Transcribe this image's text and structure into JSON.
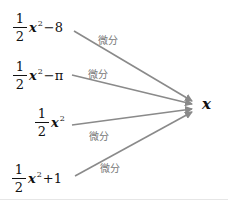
{
  "diagram": {
    "target": "x",
    "edge_label": "微分",
    "colors": {
      "arrow": "#8a8a8a",
      "label": "#777777",
      "text": "#111111"
    },
    "sources": [
      {
        "num": "1",
        "den": "2",
        "var": "x",
        "exp": "2",
        "rest": "−8",
        "label": "微分"
      },
      {
        "num": "1",
        "den": "2",
        "var": "x",
        "exp": "2",
        "rest": "−π",
        "label": "微分"
      },
      {
        "num": "1",
        "den": "2",
        "var": "x",
        "exp": "2",
        "rest": "",
        "label": "微分"
      },
      {
        "num": "1",
        "den": "2",
        "var": "x",
        "exp": "2",
        "rest": "+1",
        "label": "微分"
      }
    ]
  }
}
